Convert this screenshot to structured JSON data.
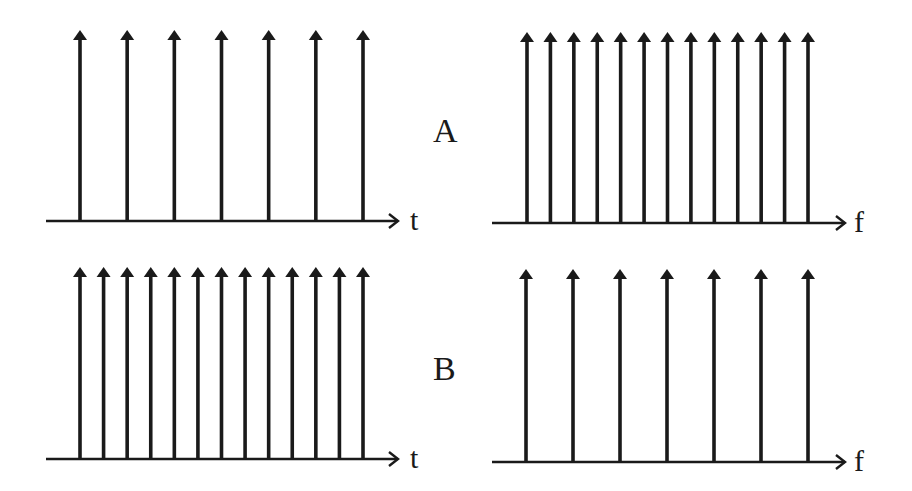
{
  "colors": {
    "ink": "#1a1a1a",
    "background": "#ffffff"
  },
  "rows": [
    {
      "label": "A",
      "label_pos": {
        "x": 433,
        "y": 142
      }
    },
    {
      "label": "B",
      "label_pos": {
        "x": 433,
        "y": 380
      }
    }
  ],
  "panels": [
    {
      "id": "A-time",
      "axis_label": "t",
      "axis": {
        "x1": 46,
        "x2": 398,
        "y": 221
      },
      "label_pos": {
        "x": 410,
        "y": 230
      },
      "impulses": {
        "count": 7,
        "first_x": 80,
        "last_x": 363,
        "top_y": 30
      }
    },
    {
      "id": "A-freq",
      "axis_label": "f",
      "axis": {
        "x1": 492,
        "x2": 845,
        "y": 223
      },
      "label_pos": {
        "x": 854,
        "y": 232
      },
      "impulses": {
        "count": 13,
        "first_x": 527,
        "last_x": 808,
        "top_y": 32
      }
    },
    {
      "id": "B-time",
      "axis_label": "t",
      "axis": {
        "x1": 46,
        "x2": 398,
        "y": 459
      },
      "label_pos": {
        "x": 410,
        "y": 468
      },
      "impulses": {
        "count": 13,
        "first_x": 80,
        "last_x": 363,
        "top_y": 267
      }
    },
    {
      "id": "B-freq",
      "axis_label": "f",
      "axis": {
        "x1": 492,
        "x2": 845,
        "y": 462
      },
      "label_pos": {
        "x": 854,
        "y": 471
      },
      "impulses": {
        "count": 7,
        "first_x": 526,
        "last_x": 808,
        "top_y": 269
      }
    }
  ],
  "chart_data": {
    "type": "diagram",
    "title": "",
    "rows": [
      {
        "label": "A",
        "time_impulses": 7,
        "freq_impulses": 13
      },
      {
        "label": "B",
        "time_impulses": 13,
        "freq_impulses": 7
      }
    ],
    "axis_labels": {
      "time": "t",
      "frequency": "f"
    }
  }
}
